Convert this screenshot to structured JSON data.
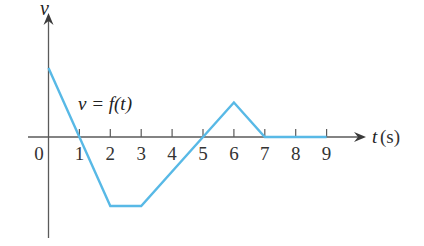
{
  "chart_data": {
    "type": "line",
    "title": "",
    "xlabel": "t (s)",
    "ylabel": "v",
    "annotation": "v = f(t)",
    "x": [
      0,
      1,
      2,
      3,
      5,
      6,
      7,
      9
    ],
    "series": [
      {
        "name": "v = f(t)",
        "values": [
          2,
          0,
          -2,
          -2,
          0,
          1,
          0,
          0
        ],
        "color": "#58b9e6"
      }
    ],
    "xticks": [
      0,
      1,
      2,
      3,
      4,
      5,
      6,
      7,
      8,
      9
    ],
    "xlim": [
      0,
      9.5
    ],
    "ylim": [
      -3,
      3.5
    ],
    "grid": false,
    "legend": "none"
  },
  "labels": {
    "y_axis": "v",
    "x_axis_var": "t",
    "x_axis_unit": "(s)",
    "function_label": "v = f(t)",
    "ticks": [
      "0",
      "1",
      "2",
      "3",
      "4",
      "5",
      "6",
      "7",
      "8",
      "9"
    ]
  }
}
